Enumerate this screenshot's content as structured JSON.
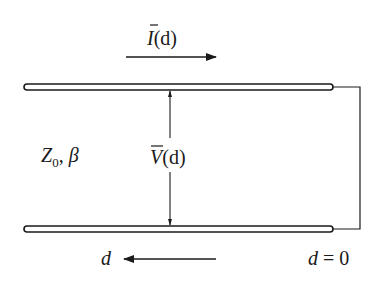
{
  "diagram": {
    "type": "transmission-line",
    "current_label": {
      "symbol": "I",
      "arg": "(d)",
      "overbar": true
    },
    "voltage_label": {
      "symbol": "V",
      "arg": "(d)",
      "overbar": true
    },
    "line_params": {
      "impedance": "Z",
      "impedance_sub": "0",
      "separator": ", ",
      "propagation": "β"
    },
    "distance_label": "d",
    "origin_label": {
      "var": "d",
      "eq": " = 0"
    },
    "colors": {
      "ink": "#1a1a1a",
      "background": "#ffffff"
    }
  }
}
